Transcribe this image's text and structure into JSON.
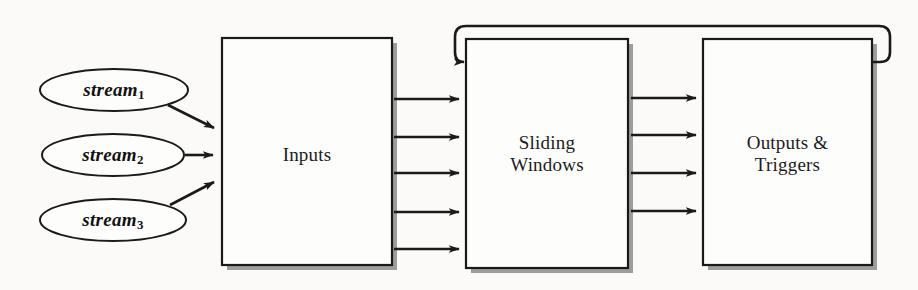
{
  "diagram": {
    "background_color": "#fbfaf8",
    "stroke_color": "#1a1a1a",
    "shadow_color": "#8d8d8d",
    "fill_color": "#fdfdfc",
    "streams": [
      {
        "label": "stream",
        "subscript": "1"
      },
      {
        "label": "stream",
        "subscript": "2"
      },
      {
        "label": "stream",
        "subscript": "3"
      }
    ],
    "boxes": [
      {
        "id": "inputs",
        "label": "Inputs"
      },
      {
        "id": "sliding-windows",
        "label": "Sliding\nWindows"
      },
      {
        "id": "outputs-triggers",
        "label": "Outputs &\nTriggers"
      }
    ],
    "connections": {
      "streams_to_inputs": 3,
      "inputs_to_sliding_windows": 5,
      "sliding_windows_to_outputs": 4,
      "feedback_loop": {
        "from": "outputs-triggers",
        "to": "sliding-windows",
        "description": "feedback loop from Outputs & Triggers back to Sliding Windows"
      }
    }
  }
}
